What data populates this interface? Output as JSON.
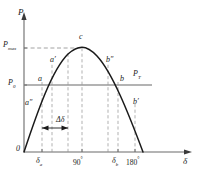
{
  "figure": {
    "type": "power-angle-characteristic",
    "title": "",
    "axes": {
      "y_label": "P",
      "x_label": "δ",
      "origin_label": "0"
    },
    "y_ticks": [
      {
        "id": "pmax",
        "label_main": "P",
        "label_sub": "max",
        "value_y": 48
      },
      {
        "id": "p0",
        "label_main": "P",
        "label_sub": "0",
        "value_y": 85
      }
    ],
    "x_ticks": [
      {
        "id": "delta_a",
        "label_main": "δ",
        "label_sub": "a",
        "x": 42
      },
      {
        "id": "deg90",
        "label_main": "90",
        "label_sup": "°",
        "x": 82
      },
      {
        "id": "delta_b",
        "label_main": "δ",
        "label_sub": "b",
        "x": 118
      },
      {
        "id": "deg180",
        "label_main": "180",
        "label_sup": "°",
        "x": 135
      }
    ],
    "horizontal_line": {
      "id": "pt-line",
      "label": "P",
      "label_sub": "T",
      "y": 85
    },
    "curve_points": [
      {
        "id": "a",
        "label": "a",
        "x": 42,
        "y": 85
      },
      {
        "id": "a-prime",
        "label": "a′",
        "x": 52,
        "y": 66
      },
      {
        "id": "a-dprime",
        "label": "a″",
        "x": 32,
        "y": 108
      },
      {
        "id": "c",
        "label": "c",
        "x": 82,
        "y": 48
      },
      {
        "id": "b",
        "label": "b",
        "x": 118,
        "y": 85
      },
      {
        "id": "b-dprime",
        "label": "b″",
        "x": 108,
        "y": 66
      },
      {
        "id": "b-prime",
        "label": "b′",
        "x": 135,
        "y": 108
      }
    ],
    "annotation": {
      "id": "delta-shift",
      "label": "Δδ",
      "from_x": 42,
      "to_x": 68,
      "y": 128
    },
    "colors": {
      "curve": "#1a1a1a",
      "axis": "#5a5a5a",
      "dashed": "#8a8a8a",
      "pt_line": "#8a8a8a",
      "text": "#1a1a1a"
    }
  }
}
